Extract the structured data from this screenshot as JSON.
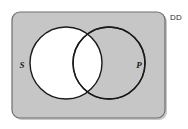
{
  "figure": {
    "name": "venn-diagram",
    "type": "two-set-venn",
    "universe_label": "DD",
    "sets": [
      {
        "id": "S",
        "label": "S",
        "label_x": 22,
        "label_y": 66
      },
      {
        "id": "P",
        "label": "P",
        "label_y": 66,
        "label_x": 139
      }
    ],
    "colors": {
      "universe_fill": "#c6c6c6",
      "universe_stroke": "#6e6e6e",
      "circle_fill": "#ffffff",
      "circle_stroke": "#1a1a1a",
      "label_color": "#1a1a1a",
      "shadow": "#9a9a9a",
      "background": "#ffffff"
    },
    "geometry": {
      "rect": {
        "x": 12,
        "y": 12,
        "width": 153,
        "height": 106,
        "rx": 8
      },
      "circle_left": {
        "cx": 66,
        "cy": 63,
        "r": 36
      },
      "circle_right": {
        "cx": 109,
        "cy": 63,
        "r": 36
      }
    }
  }
}
